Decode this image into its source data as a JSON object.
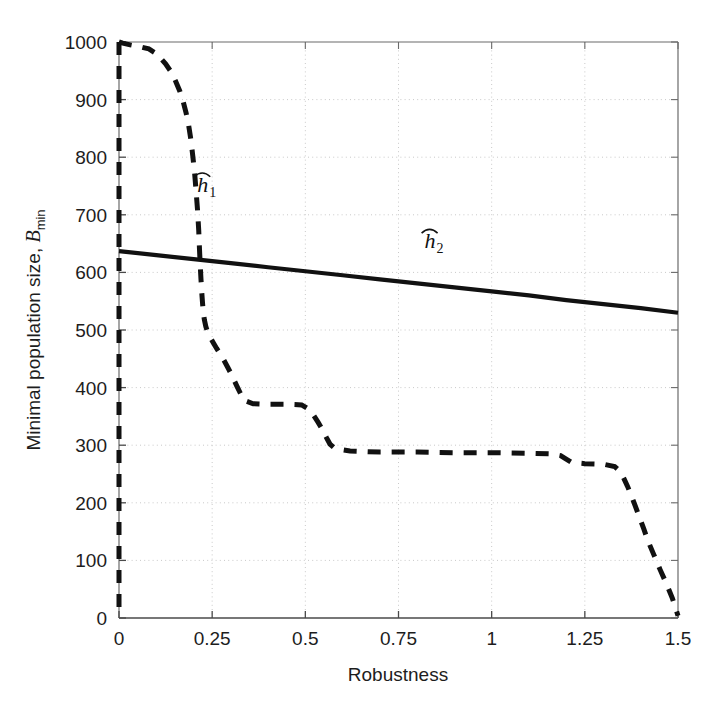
{
  "figure": {
    "background_color": "#ffffff",
    "axis_color": "#555555",
    "grid_color": "#c9c9c9",
    "series_color": "#111111"
  },
  "chart_data": {
    "type": "line",
    "title": "",
    "xlabel": "Robustness",
    "ylabel": "Minimal population size, Bmin",
    "ylabel_main": "Minimal population size, ",
    "ylabel_italic": "B",
    "ylabel_subscript": "min",
    "xlim": [
      0,
      1.5
    ],
    "ylim": [
      0,
      1000
    ],
    "grid": true,
    "legend_position": "inline-annotation",
    "xticks": [
      0,
      0.25,
      0.5,
      0.75,
      1,
      1.25,
      1.5
    ],
    "xticklabels": [
      "0",
      "0.25",
      "0.5",
      "0.75",
      "1",
      "1.25",
      "1.5"
    ],
    "yticks": [
      0,
      100,
      200,
      300,
      400,
      500,
      600,
      700,
      800,
      900,
      1000
    ],
    "yticklabels": [
      "0",
      "100",
      "200",
      "300",
      "400",
      "500",
      "600",
      "700",
      "800",
      "900",
      "1000"
    ],
    "series": [
      {
        "name": "h1hat",
        "label": "h",
        "label_subscript": "1",
        "style": "dashed",
        "annotation_x": 0.21,
        "annotation_y": 740,
        "x": [
          0.0,
          0.01,
          0.03,
          0.055,
          0.08,
          0.095,
          0.11,
          0.125,
          0.14,
          0.152,
          0.163,
          0.172,
          0.18,
          0.187,
          0.193,
          0.198,
          0.203,
          0.207,
          0.211,
          0.214,
          0.216,
          0.218,
          0.22,
          0.222,
          0.224,
          0.226,
          0.229,
          0.233,
          0.238,
          0.245,
          0.253,
          0.262,
          0.272,
          0.282,
          0.292,
          0.3,
          0.308,
          0.316,
          0.325,
          0.335,
          0.36,
          0.4,
          0.45,
          0.49,
          0.51,
          0.522,
          0.534,
          0.546,
          0.556,
          0.566,
          0.58,
          0.62,
          0.7,
          0.8,
          0.9,
          1.0,
          1.1,
          1.16,
          1.185,
          1.2,
          1.215,
          1.25,
          1.3,
          1.33,
          1.345,
          1.355,
          1.365,
          1.375,
          1.385,
          1.396,
          1.408,
          1.42,
          1.435,
          1.452,
          1.47,
          1.485,
          1.495,
          1.5
        ],
        "y": [
          1000,
          998,
          995,
          992,
          988,
          982,
          973,
          962,
          948,
          932,
          915,
          897,
          877,
          855,
          830,
          802,
          772,
          740,
          706,
          672,
          640,
          612,
          588,
          566,
          548,
          532,
          518,
          506,
          496,
          487,
          478,
          468,
          458,
          447,
          435,
          425,
          414,
          403,
          391,
          378,
          372,
          371,
          371,
          370,
          362,
          352,
          340,
          327,
          314,
          302,
          294,
          290,
          288,
          288,
          287,
          287,
          286,
          285,
          282,
          276,
          270,
          268,
          267,
          263,
          254,
          242,
          228,
          212,
          195,
          176,
          155,
          133,
          110,
          84,
          58,
          34,
          14,
          4
        ]
      },
      {
        "name": "h2hat",
        "label": "h",
        "label_subscript": "2",
        "style": "solid",
        "annotation_x": 0.82,
        "annotation_y": 642,
        "x": [
          0.0,
          0.1,
          0.2,
          0.3,
          0.4,
          0.5,
          0.6,
          0.7,
          0.8,
          0.9,
          1.0,
          1.1,
          1.2,
          1.3,
          1.4,
          1.5
        ],
        "y": [
          637,
          630,
          623,
          616,
          609,
          602,
          595,
          588,
          581,
          574,
          567,
          560,
          552,
          545,
          538,
          530
        ]
      }
    ]
  }
}
